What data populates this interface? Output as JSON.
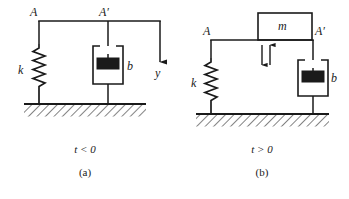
{
  "figure": {
    "type": "mechanical-schematic",
    "background": "#ffffff",
    "ink": "#1a1a1a",
    "panels": [
      {
        "id": "a",
        "label_point_left": "A",
        "label_point_right": "A′",
        "spring_label": "k",
        "damper_label": "b",
        "displacement_label": "y",
        "mass_label": null,
        "condition": "t < 0",
        "condition_symbol": "<",
        "condition_value": "0",
        "condition_variable": "t",
        "index": "(a)",
        "has_mass": false,
        "has_displacement_arrow": true,
        "has_motion_arrows": false
      },
      {
        "id": "b",
        "label_point_left": "A",
        "label_point_right": "A′",
        "spring_label": "k",
        "damper_label": "b",
        "displacement_label": null,
        "mass_label": "m",
        "condition": "t > 0",
        "condition_symbol": ">",
        "condition_value": "0",
        "condition_variable": "t",
        "index": "(b)",
        "has_mass": true,
        "has_displacement_arrow": false,
        "has_motion_arrows": true
      }
    ]
  }
}
